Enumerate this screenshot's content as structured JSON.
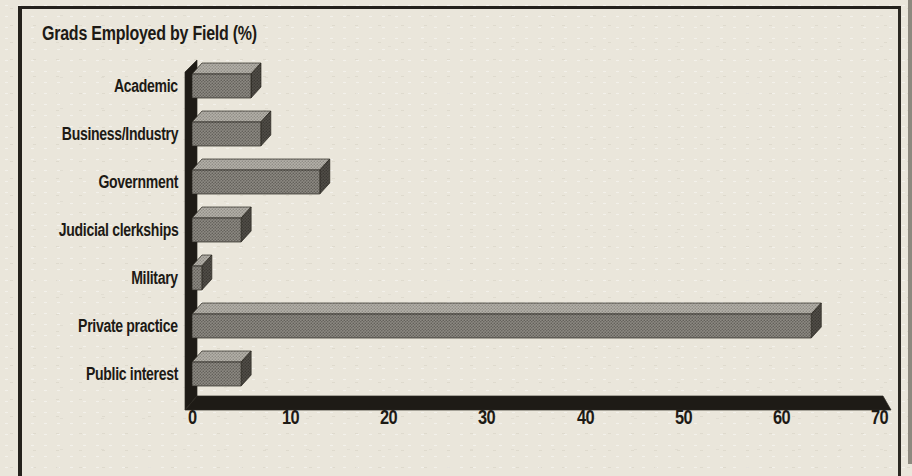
{
  "chart_data": {
    "type": "bar",
    "orientation": "horizontal",
    "style": "3d-block-bars",
    "title": "Grads Employed by Field (%)",
    "categories": [
      "Academic",
      "Business/Industry",
      "Government",
      "Judicial clerkships",
      "Military",
      "Private practice",
      "Public interest"
    ],
    "values": [
      6,
      7,
      13,
      5,
      1,
      63,
      5
    ],
    "xlabel": "",
    "ylabel": "",
    "xlim": [
      0,
      70
    ],
    "xticks": [
      0,
      10,
      20,
      30,
      40,
      50,
      60,
      70
    ],
    "grid": false,
    "legend": false,
    "colors": {
      "background": "#eae6db",
      "ink": "#1d1a15",
      "axis_wall": "#1e1b16",
      "bar_front": "#8d8a83",
      "bar_front_dot": "#615e58",
      "bar_top": "#b4b1a9",
      "bar_top_dot": "#8f8c85",
      "bar_side": "#514e48",
      "bar_side_dot": "#393631",
      "outline": "#29261f"
    }
  }
}
